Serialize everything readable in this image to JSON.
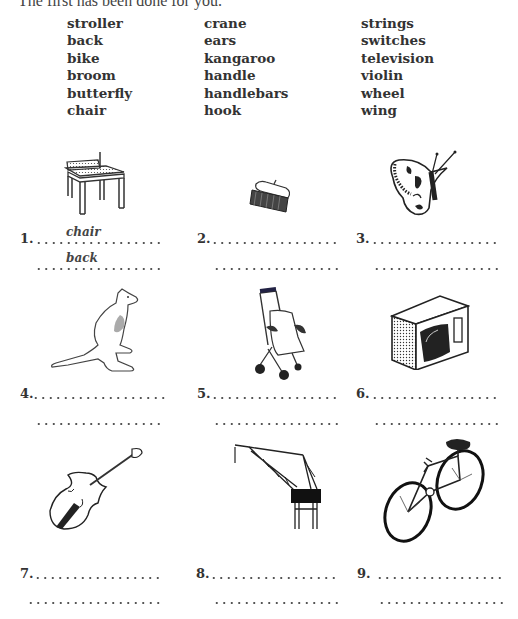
{
  "instruction": "The first has been done for you.",
  "word_bank": {
    "column1": [
      "stroller",
      "back",
      "bike",
      "broom",
      "butterfly",
      "chair"
    ],
    "column2": [
      "crane",
      "ears",
      "kangaroo",
      "handle",
      "handlebars",
      "hook"
    ],
    "column3": [
      "strings",
      "switches",
      "television",
      "violin",
      "wheel",
      "wing"
    ]
  },
  "items": [
    {
      "number": "1.",
      "picture": "chair",
      "answers": [
        "chair",
        "back"
      ]
    },
    {
      "number": "2.",
      "picture": "broom",
      "answers": [
        "",
        ""
      ]
    },
    {
      "number": "3.",
      "picture": "butterfly",
      "answers": [
        "",
        ""
      ]
    },
    {
      "number": "4.",
      "picture": "kangaroo",
      "answers": [
        "",
        ""
      ]
    },
    {
      "number": "5.",
      "picture": "stroller",
      "answers": [
        "",
        ""
      ]
    },
    {
      "number": "6.",
      "picture": "television",
      "answers": [
        "",
        ""
      ]
    },
    {
      "number": "7.",
      "picture": "violin",
      "answers": [
        "",
        ""
      ]
    },
    {
      "number": "8.",
      "picture": "crane",
      "answers": [
        "",
        ""
      ]
    },
    {
      "number": "9.",
      "picture": "bike",
      "answers": [
        "",
        ""
      ]
    }
  ]
}
